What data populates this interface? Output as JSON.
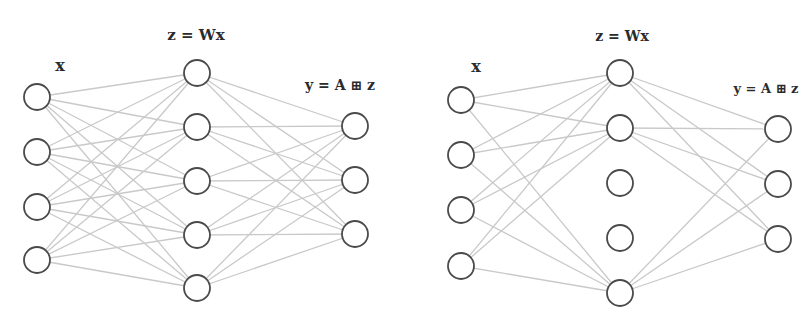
{
  "figure": {
    "panels": [
      {
        "id": "dense",
        "labels": {
          "input": "x",
          "hidden": "z = Wx",
          "output": "y = A ⊞ z"
        },
        "label_positions": {
          "input": [
            60,
            71
          ],
          "hidden": [
            196,
            40
          ],
          "output": [
            340,
            90
          ]
        },
        "layers": {
          "input": {
            "x": 37,
            "y": [
              97,
              152,
              207,
              260
            ]
          },
          "hidden": {
            "x": 197,
            "y": [
              73,
              127,
              181,
              235,
              288
            ]
          },
          "output": {
            "x": 355,
            "y": [
              126,
              180,
              234
            ]
          }
        },
        "active_hidden": [
          0,
          1,
          2,
          3,
          4
        ]
      },
      {
        "id": "pruned",
        "labels": {
          "input": "x",
          "hidden": "z = Wx",
          "output": "y = A ⊞ z"
        },
        "label_positions": {
          "input": [
            476,
            72
          ],
          "hidden": [
            622,
            41
          ],
          "output": [
            766,
            93
          ]
        },
        "layers": {
          "input": {
            "x": 461,
            "y": [
              100,
              155,
              210,
              266
            ]
          },
          "hidden": {
            "x": 620,
            "y": [
              73,
              128,
              183,
              238,
              293
            ]
          },
          "output": {
            "x": 778,
            "y": [
              129,
              184,
              239
            ]
          }
        },
        "active_hidden": [
          0,
          1,
          4
        ]
      }
    ],
    "node_radius": 13,
    "colors": {
      "edge": "#c9c9c9",
      "node_stroke": "#4a4a4a",
      "node_fill": "#ffffff",
      "label": "#2b2b2b"
    }
  }
}
